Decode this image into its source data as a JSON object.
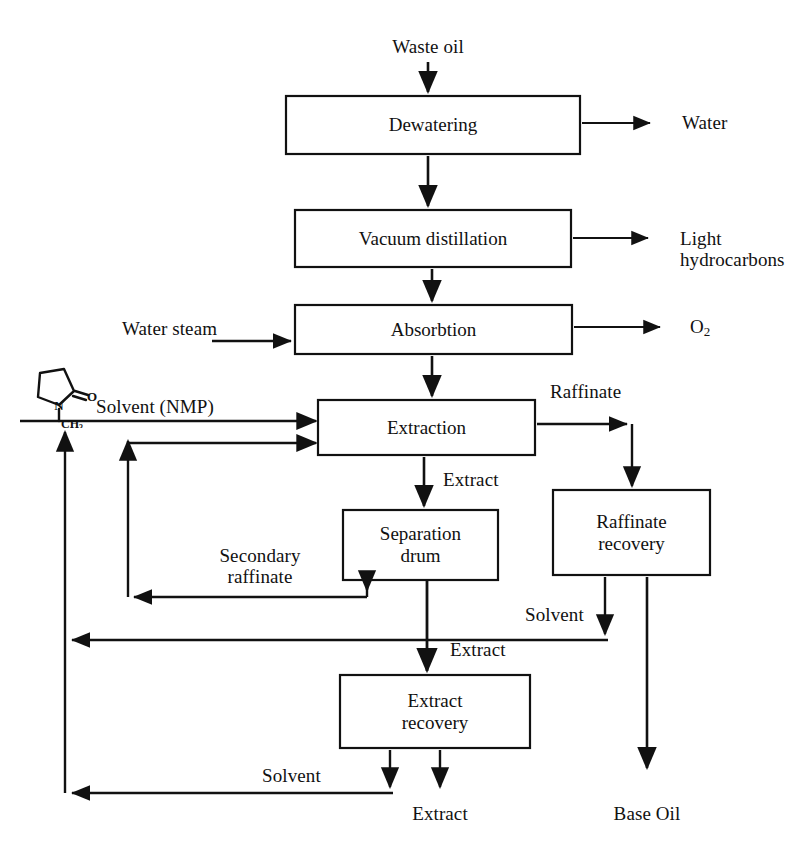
{
  "diagram": {
    "background": "#ffffff",
    "line_color": "#111111",
    "boxes": [
      {
        "id": "dewatering",
        "label": "Dewatering",
        "x": 286,
        "y": 96,
        "w": 294,
        "h": 58
      },
      {
        "id": "vacuum_distillation",
        "label": "Vacuum distillation",
        "x": 295,
        "y": 210,
        "w": 276,
        "h": 57
      },
      {
        "id": "absorbtion",
        "label": "Absorbtion",
        "x": 295,
        "y": 305,
        "w": 277,
        "h": 49
      },
      {
        "id": "extraction",
        "label": "Extraction",
        "x": 318,
        "y": 400,
        "w": 217,
        "h": 55
      },
      {
        "id": "separation_drum",
        "label": "Separation\ndrum",
        "x": 343,
        "y": 510,
        "w": 155,
        "h": 70
      },
      {
        "id": "raffinate_recovery",
        "label": "Raffinate\nrecovery",
        "x": 553,
        "y": 490,
        "w": 157,
        "h": 85
      },
      {
        "id": "extract_recovery",
        "label": "Extract\nrecovery",
        "x": 340,
        "y": 675,
        "w": 190,
        "h": 73
      }
    ],
    "stream_labels": [
      {
        "id": "waste_oil",
        "text": "Waste oil",
        "x": 428,
        "y": 36,
        "align": "center"
      },
      {
        "id": "water",
        "text": "Water",
        "x": 682,
        "y": 112,
        "align": "left"
      },
      {
        "id": "light_hydrocarbons",
        "text": "Light\nhydrocarbons",
        "x": 680,
        "y": 228,
        "align": "left"
      },
      {
        "id": "oxygen",
        "text": "O2",
        "x": 690,
        "y": 318,
        "align": "left"
      },
      {
        "id": "water_steam",
        "text": "Water steam",
        "x": 122,
        "y": 318,
        "align": "left"
      },
      {
        "id": "solvent_nmp",
        "text": "Solvent (NMP)",
        "x": 96,
        "y": 396,
        "align": "left"
      },
      {
        "id": "raffinate",
        "text": "Raffinate",
        "x": 550,
        "y": 381,
        "align": "left"
      },
      {
        "id": "extract_top",
        "text": "Extract",
        "x": 443,
        "y": 469,
        "align": "left"
      },
      {
        "id": "secondary_raffinate",
        "text": "Secondary\nraffinate",
        "x": 218,
        "y": 545,
        "align": "left"
      },
      {
        "id": "solvent_raffinate",
        "text": "Solvent",
        "x": 525,
        "y": 604,
        "align": "left"
      },
      {
        "id": "extract_mid",
        "text": "Extract",
        "x": 450,
        "y": 639,
        "align": "left"
      },
      {
        "id": "solvent_extract",
        "text": "Solvent",
        "x": 262,
        "y": 765,
        "align": "left"
      },
      {
        "id": "extract_bottom",
        "text": "Extract",
        "x": 440,
        "y": 803,
        "align": "center"
      },
      {
        "id": "base_oil",
        "text": "Base Oil",
        "x": 647,
        "y": 803,
        "align": "center"
      }
    ],
    "molecule": {
      "id": "nmp-molecule",
      "name": "N-methyl-2-pyrrolidone",
      "atom_labels": [
        "N",
        "O",
        "CH3"
      ]
    },
    "connections": [
      {
        "id": "waste-oil-in",
        "from": "waste_oil",
        "to": "dewatering"
      },
      {
        "id": "dewatering-water",
        "from": "dewatering",
        "to": "water"
      },
      {
        "id": "dewatering-vacuum",
        "from": "dewatering",
        "to": "vacuum_distillation"
      },
      {
        "id": "vacuum-light-hc",
        "from": "vacuum_distillation",
        "to": "light_hydrocarbons"
      },
      {
        "id": "vacuum-absorbtion",
        "from": "vacuum_distillation",
        "to": "absorbtion"
      },
      {
        "id": "steam-absorbtion",
        "from": "water_steam",
        "to": "absorbtion"
      },
      {
        "id": "absorbtion-o2",
        "from": "absorbtion",
        "to": "oxygen"
      },
      {
        "id": "absorbtion-extraction",
        "from": "absorbtion",
        "to": "extraction"
      },
      {
        "id": "solvent-extraction",
        "from": "solvent_nmp",
        "to": "extraction"
      },
      {
        "id": "secraff-extraction",
        "from": "separation_drum",
        "to": "extraction"
      },
      {
        "id": "extraction-raffinate",
        "from": "extraction",
        "to": "raffinate_recovery"
      },
      {
        "id": "extraction-sepdrum",
        "from": "extraction",
        "to": "separation_drum"
      },
      {
        "id": "sepdrum-extract",
        "from": "separation_drum",
        "to": "extract_recovery"
      },
      {
        "id": "raffrec-solvent",
        "from": "raffinate_recovery",
        "to": "solvent_nmp"
      },
      {
        "id": "raffrec-baseoil",
        "from": "raffinate_recovery",
        "to": "base_oil"
      },
      {
        "id": "extrec-solvent",
        "from": "extract_recovery",
        "to": "solvent_nmp"
      },
      {
        "id": "extrec-extract",
        "from": "extract_recovery",
        "to": "extract_bottom"
      }
    ]
  }
}
